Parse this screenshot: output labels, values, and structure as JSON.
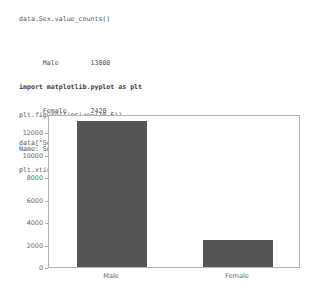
{
  "notebook": {
    "expression": "data.Sex.value_counts()",
    "series_output": {
      "rows": [
        {
          "label": "Male",
          "value": "13000"
        },
        {
          "label": "Female",
          "value": "2420"
        }
      ],
      "footer": "Name: Sex, dtype: int64"
    },
    "code_cell": {
      "lines": [
        "import matplotlib.pyplot as plt",
        "plt.figure(figsize=(10,6))",
        "data[\"Sex\"].value_counts().plot(kind=\"bar\")",
        "plt.xticks(rotation = 0);"
      ]
    }
  },
  "chart_data": {
    "type": "bar",
    "title": "",
    "xlabel": "",
    "ylabel": "",
    "categories": [
      "Male",
      "Female"
    ],
    "values": [
      13000,
      2420
    ],
    "ylim": [
      0,
      13650
    ],
    "yticks": [
      0,
      2000,
      4000,
      6000,
      8000,
      10000,
      12000
    ],
    "ytick_labels": [
      "0",
      "2000",
      "4000",
      "6000",
      "8000",
      "10000",
      "12000"
    ],
    "grid": false,
    "legend": false,
    "bar_color": "#555557",
    "axis_color": "#b4b4b4",
    "tick_label_color": "#666666"
  }
}
